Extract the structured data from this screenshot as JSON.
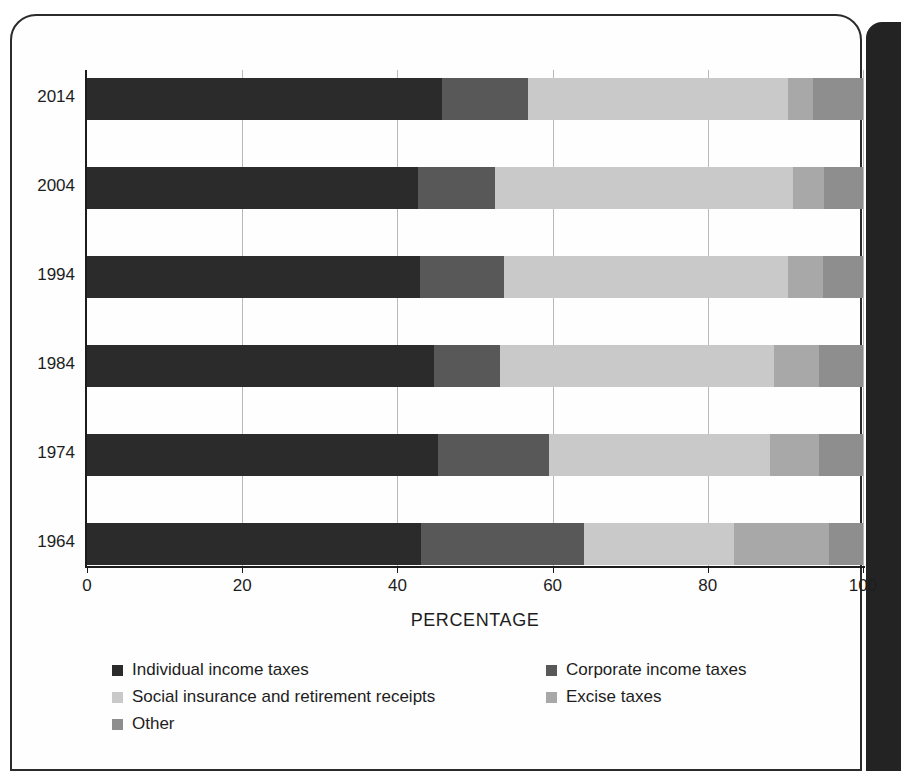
{
  "chart_data": {
    "type": "bar",
    "orientation": "horizontal",
    "stacked": true,
    "title": "",
    "xlabel": "PERCENTAGE",
    "ylabel": "",
    "xlim": [
      0,
      100
    ],
    "xticks": [
      0,
      20,
      40,
      60,
      80,
      100
    ],
    "xtick_labels": [
      "0",
      "20",
      "40",
      "60",
      "80",
      "100"
    ],
    "grid": true,
    "grid_axis": "x",
    "legend_position": "below",
    "categories": [
      "2014",
      "2004",
      "1994",
      "1984",
      "1974",
      "1964"
    ],
    "series": [
      {
        "name": "Individual income taxes",
        "color": "#2b2b2b",
        "values": [
          45.8,
          42.6,
          42.9,
          44.7,
          45.2,
          43.1
        ]
      },
      {
        "name": "Corporate income taxes",
        "color": "#585858",
        "values": [
          11.0,
          10.0,
          10.9,
          8.5,
          14.3,
          20.9
        ]
      },
      {
        "name": "Social insurance and retirement receipts",
        "color": "#c9c9c9",
        "values": [
          33.5,
          38.4,
          36.5,
          35.3,
          28.5,
          19.4
        ]
      },
      {
        "name": "Excise taxes",
        "color": "#a8a8a8",
        "values": [
          3.2,
          4.0,
          4.6,
          5.8,
          6.3,
          12.2
        ]
      },
      {
        "name": "Other",
        "color": "#8e8e8e",
        "values": [
          6.5,
          5.0,
          5.1,
          5.7,
          5.7,
          4.4
        ]
      }
    ]
  },
  "axis": {
    "tick_0": "0",
    "tick_20": "20",
    "tick_40": "40",
    "tick_60": "60",
    "tick_80": "80",
    "tick_100": "100",
    "x_title": "PERCENTAGE"
  },
  "categories": {
    "c0": "2014",
    "c1": "2004",
    "c2": "1994",
    "c3": "1984",
    "c4": "1974",
    "c5": "1964"
  },
  "legend": {
    "individual": "Individual income taxes",
    "corporate": "Corporate income taxes",
    "social": "Social insurance and retirement receipts",
    "excise": "Excise taxes",
    "other": "Other"
  }
}
